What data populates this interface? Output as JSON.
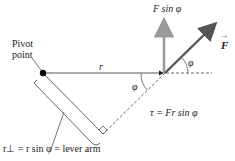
{
  "diagram": {
    "labels": {
      "pivot_line1": "Pivot",
      "pivot_line2": "point",
      "r": "r",
      "phi_top": "φ",
      "phi_bottom": "φ",
      "fsin": "F sin φ",
      "F": "F",
      "F_arrow": "→",
      "torque": "τ = Fr sin φ",
      "lever_arm": "r⊥ = r sin φ = lever arm"
    },
    "colors": {
      "force": "#555555",
      "component": "#9a9a9a",
      "line": "#333333"
    }
  }
}
